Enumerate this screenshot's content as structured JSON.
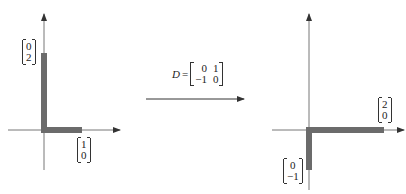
{
  "colors": {
    "axis": "#666666",
    "bar": "#6b6b6b",
    "text": "#222222"
  },
  "left_figure": {
    "vector_e2": [
      "0",
      "2"
    ],
    "vector_e1": [
      "1",
      "0"
    ]
  },
  "transform": {
    "symbol": "D",
    "equals": "=",
    "matrix": [
      [
        "0",
        "1"
      ],
      [
        "−1",
        "0"
      ]
    ]
  },
  "right_figure": {
    "vector_e1_image": [
      "2",
      "0"
    ],
    "vector_e2_image": [
      "0",
      "−1"
    ]
  }
}
